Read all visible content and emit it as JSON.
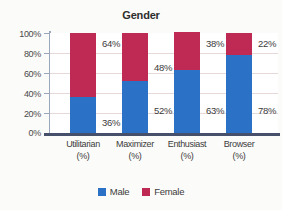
{
  "chart_data": {
    "type": "bar",
    "subtype": "stacked-column-100",
    "title": "Gender",
    "xlabel": "",
    "ylabel": "",
    "ylim": [
      0,
      100
    ],
    "ytick_labels": [
      "100%",
      "80%",
      "60%",
      "40%",
      "20%",
      "0%"
    ],
    "ytick_values": [
      100,
      80,
      60,
      40,
      20,
      0
    ],
    "grid": true,
    "legend_position": "bottom",
    "categories": [
      "Utilitarian",
      "Maximizer",
      "Enthusiast",
      "Browser"
    ],
    "category_unit": "(%)",
    "category_labels": [
      {
        "name": "Utilitarian",
        "unit": "(%)"
      },
      {
        "name": "Maximizer",
        "unit": "(%)"
      },
      {
        "name": "Enthusiast",
        "unit": "(%)"
      },
      {
        "name": "Browser",
        "unit": "(%)"
      }
    ],
    "series": [
      {
        "name": "Male",
        "color": "#2b72c6",
        "values": [
          36,
          52,
          63,
          78
        ],
        "labels": [
          "36%",
          "52%",
          "63%",
          "78%"
        ]
      },
      {
        "name": "Female",
        "color": "#bf2a55",
        "values": [
          64,
          48,
          38,
          22
        ],
        "labels": [
          "64%",
          "48%",
          "38%",
          "22%"
        ]
      }
    ],
    "legend": [
      {
        "label": "Male",
        "color": "#2b72c6"
      },
      {
        "label": "Female",
        "color": "#bf2a55"
      }
    ],
    "colors": {
      "male": "#2b72c6",
      "female": "#bf2a55",
      "gridline": "#e8d9d9",
      "axis": "#46506a",
      "y_axis": "#9aa6bb",
      "plot_background": "#ffffff",
      "page_background": "#fbfbf9"
    }
  }
}
